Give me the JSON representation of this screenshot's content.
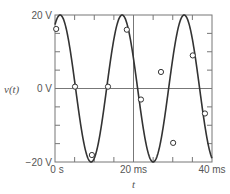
{
  "chart_data": {
    "type": "line",
    "title": "",
    "xlabel": "t",
    "ylabel": "v(t)",
    "xlim": [
      0,
      40
    ],
    "ylim": [
      -20,
      20
    ],
    "x_unit": "ms",
    "y_unit": "V",
    "x_tick_labels": [
      "0 s",
      "20 ms",
      "40 ms"
    ],
    "y_tick_labels": [
      "20 V",
      "0 V",
      "−20 V"
    ],
    "grid": false,
    "series": [
      {
        "name": "v(t)",
        "kind": "sinusoid",
        "amplitude": 20,
        "period_ms": 15.8,
        "peak_time_ms": 1.3
      },
      {
        "name": "samples",
        "kind": "markers",
        "x": [
          0.3,
          5.1,
          9.4,
          13.5,
          18.3,
          21.9,
          27.0,
          30.1,
          35.1,
          38.2
        ],
        "y": [
          16.2,
          0.5,
          -18.1,
          0.5,
          16.0,
          -3.0,
          4.5,
          -14.8,
          9.0,
          -6.8
        ]
      }
    ]
  }
}
